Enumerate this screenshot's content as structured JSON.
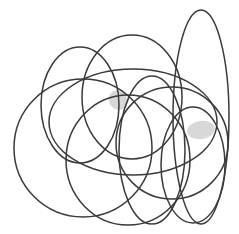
{
  "figure": {
    "canvas": {
      "width": 239,
      "height": 234,
      "background_color": "#ffffff"
    },
    "style": {
      "stroke_color": "#3a3a3a",
      "stroke_width": 1.5,
      "fill": "none",
      "shade_color": "#d8d8d8"
    },
    "shape_count": 9,
    "shaded_region_count": 2,
    "ellipses": [
      {
        "id": "ellipse-tall-right",
        "label": "tall narrow ellipse, upper right",
        "cx": 201,
        "cy": 117,
        "rx": 28,
        "ry": 107,
        "rotation": 0
      },
      {
        "id": "ellipse-upper-middle",
        "label": "upper middle ellipse",
        "cx": 132,
        "cy": 97,
        "rx": 50,
        "ry": 62,
        "rotation": 0
      },
      {
        "id": "ellipse-left-upper",
        "label": "left upper tall ellipse",
        "cx": 80,
        "cy": 105,
        "rx": 39,
        "ry": 58,
        "rotation": 0
      },
      {
        "id": "ellipse-big-left",
        "label": "large left circle",
        "cx": 83,
        "cy": 148,
        "rx": 69,
        "ry": 69,
        "rotation": 0
      },
      {
        "id": "ellipse-wide-middle",
        "label": "wide middle ellipse",
        "cx": 133,
        "cy": 122,
        "rx": 84,
        "ry": 53,
        "rotation": 0
      },
      {
        "id": "ellipse-right-circle",
        "label": "right circle",
        "cx": 172,
        "cy": 143,
        "rx": 56,
        "ry": 56,
        "rotation": 0
      },
      {
        "id": "ellipse-center-tall",
        "label": "center tall ellipse",
        "cx": 152,
        "cy": 150,
        "rx": 33,
        "ry": 74,
        "rotation": 0
      },
      {
        "id": "ellipse-lower-center",
        "label": "lower center ellipse",
        "cx": 128,
        "cy": 160,
        "rx": 62,
        "ry": 65,
        "rotation": 0
      },
      {
        "id": "ellipse-lower-right",
        "label": "lower right narrow ellipse",
        "cx": 193,
        "cy": 165,
        "rx": 32,
        "ry": 58,
        "rotation": 0
      }
    ],
    "shaded_regions": [
      {
        "id": "lens-upper",
        "label": "small shaded lens, upper middle",
        "cx": 118,
        "cy": 100,
        "rx": 9,
        "ry": 10,
        "rotation": -35
      },
      {
        "id": "lens-right",
        "label": "shaded lens, right of center",
        "cx": 201,
        "cy": 130,
        "rx": 14,
        "ry": 9,
        "rotation": -8
      }
    ]
  }
}
